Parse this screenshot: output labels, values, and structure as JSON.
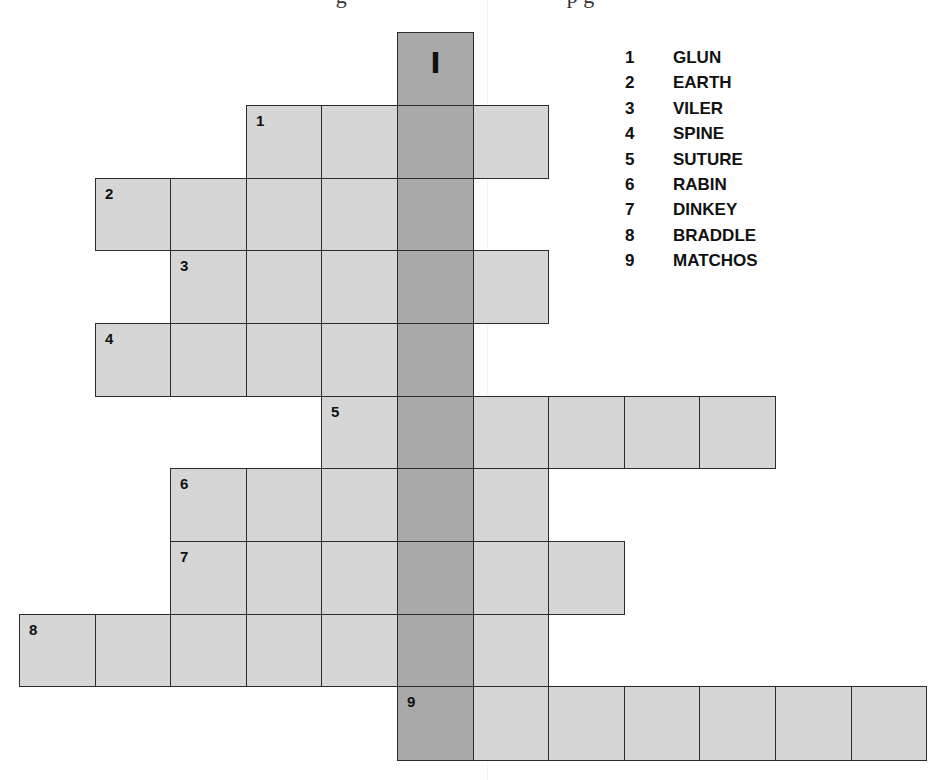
{
  "heading_fragment": "g                                        p g",
  "key_column": {
    "label": "I",
    "col": 5
  },
  "grid": {
    "origin_x": 19,
    "col_width": 75.6,
    "row_tops": [
      32,
      105,
      178,
      250,
      323,
      396,
      468,
      541,
      614,
      686,
      760
    ],
    "colors": {
      "cell": "#d6d6d6",
      "shaded": "#a9a9a9",
      "border": "#2b2b2b"
    }
  },
  "entries": [
    {
      "number": "1",
      "word": "GLUN",
      "row": 1,
      "start_col": 3,
      "length": 4
    },
    {
      "number": "2",
      "word": "EARTH",
      "row": 2,
      "start_col": 1,
      "length": 5
    },
    {
      "number": "3",
      "word": "VILER",
      "row": 3,
      "start_col": 2,
      "length": 5
    },
    {
      "number": "4",
      "word": "SPINE",
      "row": 4,
      "start_col": 1,
      "length": 5
    },
    {
      "number": "5",
      "word": "SUTURE",
      "row": 5,
      "start_col": 4,
      "length": 6
    },
    {
      "number": "6",
      "word": "RABIN",
      "row": 6,
      "start_col": 2,
      "length": 5
    },
    {
      "number": "7",
      "word": "DINKEY",
      "row": 7,
      "start_col": 2,
      "length": 6
    },
    {
      "number": "8",
      "word": "BRADDLE",
      "row": 8,
      "start_col": 0,
      "length": 7
    },
    {
      "number": "9",
      "word": "MATCHOS",
      "row": 9,
      "start_col": 5,
      "length": 7
    }
  ],
  "word_list": [
    {
      "number": "1",
      "word": "GLUN"
    },
    {
      "number": "2",
      "word": "EARTH"
    },
    {
      "number": "3",
      "word": "VILER"
    },
    {
      "number": "4",
      "word": "SPINE"
    },
    {
      "number": "5",
      "word": "SUTURE"
    },
    {
      "number": "6",
      "word": "RABIN"
    },
    {
      "number": "7",
      "word": "DINKEY"
    },
    {
      "number": "8",
      "word": "BRADDLE"
    },
    {
      "number": "9",
      "word": "MATCHOS"
    }
  ]
}
